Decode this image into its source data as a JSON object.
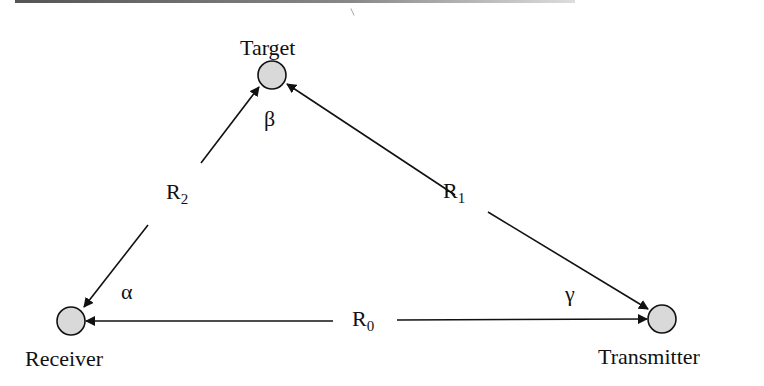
{
  "diagram": {
    "type": "bistatic-radar-geometry",
    "nodes": {
      "target": {
        "label": "Target",
        "x": 272,
        "y": 75
      },
      "receiver": {
        "label": "Receiver",
        "x": 71,
        "y": 321
      },
      "transmitter": {
        "label": "Transmitter",
        "x": 662,
        "y": 319
      }
    },
    "edges": {
      "r0": {
        "base": "R",
        "sub": "0",
        "from": "transmitter",
        "to": "receiver",
        "arrows": "both"
      },
      "r1": {
        "base": "R",
        "sub": "1",
        "from": "target",
        "to": "transmitter",
        "arrows": "both"
      },
      "r2": {
        "base": "R",
        "sub": "2",
        "from": "receiver",
        "to": "target",
        "arrows": "both"
      }
    },
    "angles": {
      "alpha": {
        "symbol": "α",
        "at": "receiver"
      },
      "beta": {
        "symbol": "β",
        "at": "target"
      },
      "gamma": {
        "symbol": "γ",
        "at": "transmitter"
      }
    },
    "colors": {
      "node_fill": "#d9d9d9",
      "stroke": "#111111"
    }
  }
}
